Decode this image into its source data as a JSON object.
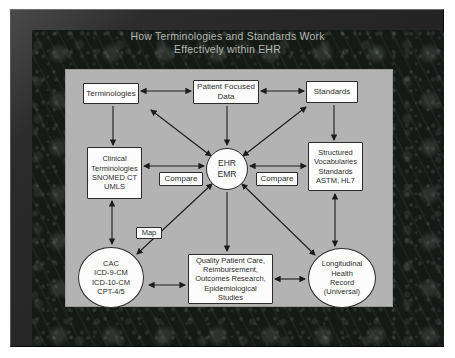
{
  "title": "How Terminologies and Standards Work\nEffectively within EHR",
  "colors": {
    "frame": "#2c2c2c",
    "marble_base": "#161a17",
    "panel_bg": "#b3b3b3",
    "box_bg": "#fcfcfc",
    "box_border": "#2b2b2b",
    "arrow": "#1c1c1c",
    "title_text": "#b2b6b2"
  },
  "nodes": [
    {
      "id": "terminologies",
      "label": "Terminologies",
      "shape": "rect",
      "x": 17,
      "y": 13,
      "w": 56,
      "h": 21,
      "fs": 8
    },
    {
      "id": "patient-focused-data",
      "label": "Patient Focused\nData",
      "shape": "rect",
      "x": 127,
      "y": 10,
      "w": 66,
      "h": 24,
      "fs": 8
    },
    {
      "id": "standards",
      "label": "Standards",
      "shape": "rect",
      "x": 240,
      "y": 11,
      "w": 52,
      "h": 22,
      "fs": 8
    },
    {
      "id": "clinical-terminologies",
      "label": "Clinical\nTerminologies\nSNOMED CT\nUMLS",
      "shape": "rect",
      "x": 21,
      "y": 77,
      "w": 55,
      "h": 52,
      "fs": 7.5
    },
    {
      "id": "ehr-emr",
      "label": "EHR\nEMR",
      "shape": "circle",
      "x": 140,
      "y": 78,
      "w": 42,
      "h": 42,
      "fs": 8.5
    },
    {
      "id": "structured-vocabularies",
      "label": "Structured\nVocabularies\nStandards\nASTM, HL7",
      "shape": "rect",
      "x": 242,
      "y": 72,
      "w": 55,
      "h": 49,
      "fs": 7.5
    },
    {
      "id": "compare-left",
      "label": "Compare",
      "shape": "rect",
      "x": 93,
      "y": 102,
      "w": 44,
      "h": 14,
      "fs": 8
    },
    {
      "id": "compare-right",
      "label": "Compare",
      "shape": "rect",
      "x": 190,
      "y": 102,
      "w": 42,
      "h": 14,
      "fs": 8
    },
    {
      "id": "map",
      "label": "Map",
      "shape": "rect",
      "x": 70,
      "y": 157,
      "w": 26,
      "h": 12,
      "fs": 7.5
    },
    {
      "id": "cac-codes",
      "label": "CAC\nICD-9-CM\nICD-10-CM\nCPT-4/5",
      "shape": "ellipse",
      "x": 12,
      "y": 177,
      "w": 66,
      "h": 61,
      "fs": 7.5
    },
    {
      "id": "quality-outcomes",
      "label": "Quality Patient Care,\nReimbursement,\nOutcomes Research,\nEpidemiological\nStudies",
      "shape": "rect",
      "x": 122,
      "y": 184,
      "w": 85,
      "h": 50,
      "fs": 7.5
    },
    {
      "id": "longitudinal-record",
      "label": "Longitudinal\nHealth\nRecord\n(Universal)",
      "shape": "ellipse",
      "x": 242,
      "y": 178,
      "w": 68,
      "h": 60,
      "fs": 7.5
    }
  ],
  "edges": [
    {
      "from": "terminologies",
      "to": "patient-focused-data",
      "x1": 75,
      "y1": 21,
      "x2": 125,
      "y2": 21,
      "double": true
    },
    {
      "from": "patient-focused-data",
      "to": "standards",
      "x1": 195,
      "y1": 21,
      "x2": 238,
      "y2": 21,
      "double": true
    },
    {
      "from": "terminologies",
      "to": "clinical-terminologies",
      "x1": 47,
      "y1": 36,
      "x2": 47,
      "y2": 75,
      "double": false
    },
    {
      "from": "standards",
      "to": "structured-vocabularies",
      "x1": 268,
      "y1": 35,
      "x2": 268,
      "y2": 70,
      "double": false
    },
    {
      "from": "patient-focused-data",
      "to": "ehr-emr",
      "x1": 161,
      "y1": 36,
      "x2": 161,
      "y2": 75,
      "double": false
    },
    {
      "from": "terminologies",
      "to": "ehr-emr",
      "x1": 85,
      "y1": 40,
      "x2": 145,
      "y2": 86,
      "double": true
    },
    {
      "from": "standards",
      "to": "ehr-emr",
      "x1": 240,
      "y1": 37,
      "x2": 177,
      "y2": 86,
      "double": true
    },
    {
      "from": "clinical-terminologies",
      "to": "ehr-emr",
      "x1": 78,
      "y1": 96,
      "x2": 138,
      "y2": 96,
      "double": true
    },
    {
      "from": "ehr-emr",
      "to": "structured-vocabularies",
      "x1": 184,
      "y1": 96,
      "x2": 240,
      "y2": 96,
      "double": true
    },
    {
      "from": "clinical-terminologies",
      "to": "cac-codes",
      "x1": 46,
      "y1": 131,
      "x2": 46,
      "y2": 174,
      "double": true
    },
    {
      "from": "structured-vocabularies",
      "to": "longitudinal-record",
      "x1": 269,
      "y1": 124,
      "x2": 269,
      "y2": 176,
      "double": true
    },
    {
      "from": "ehr-emr",
      "to": "cac-codes",
      "x1": 146,
      "y1": 114,
      "x2": 71,
      "y2": 184,
      "double": true
    },
    {
      "from": "ehr-emr",
      "to": "quality-outcomes",
      "x1": 161,
      "y1": 122,
      "x2": 161,
      "y2": 181,
      "double": false
    },
    {
      "from": "ehr-emr",
      "to": "longitudinal-record",
      "x1": 176,
      "y1": 114,
      "x2": 249,
      "y2": 185,
      "double": true
    },
    {
      "from": "cac-codes",
      "to": "quality-outcomes",
      "x1": 83,
      "y1": 215,
      "x2": 119,
      "y2": 215,
      "double": true
    },
    {
      "from": "quality-outcomes",
      "to": "longitudinal-record",
      "x1": 209,
      "y1": 209,
      "x2": 239,
      "y2": 209,
      "double": true
    }
  ]
}
